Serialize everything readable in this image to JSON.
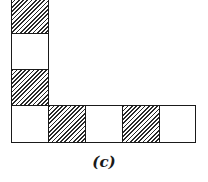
{
  "figure": {
    "caption": "(c)",
    "colors": {
      "line": "#1a1a1a",
      "hatch": "#2a2a2a",
      "background": "#ffffff"
    },
    "vertical_column": [
      {
        "index": 0,
        "fill": "hatched"
      },
      {
        "index": 1,
        "fill": "white"
      },
      {
        "index": 2,
        "fill": "hatched"
      }
    ],
    "bottom_row": [
      {
        "index": 0,
        "fill": "white"
      },
      {
        "index": 1,
        "fill": "hatched"
      },
      {
        "index": 2,
        "fill": "white"
      },
      {
        "index": 3,
        "fill": "hatched"
      },
      {
        "index": 4,
        "fill": "white"
      }
    ]
  }
}
